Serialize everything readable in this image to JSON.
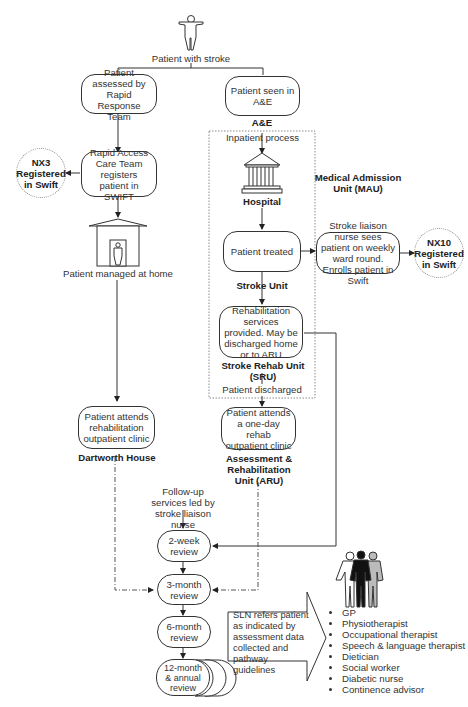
{
  "diagram": {
    "start": {
      "icon": "person-icon",
      "label": "Patient with stroke"
    },
    "left_branch": {
      "rrt_box": "Patient assessed by Rapid Response Team",
      "rapid_access_box": "Rapid Access Care Team registers patient in SWIFT",
      "nx3_badge": "NX3 Registered in Swift",
      "home_icon": "house-icon",
      "home_label": "Patient managed at home",
      "clinic_box": "Patient attends rehabilitation outpatient clinic",
      "clinic_location": "Dartworth House"
    },
    "right_branch": {
      "ae_box": "Patient seen in A&E",
      "ae_label": "A&E",
      "inpatient_label": "Inpatient process",
      "hospital_icon": "hospital-icon",
      "hospital_label": "Hospital",
      "mau_label": "Medical Admission Unit (MAU)",
      "treated_box": "Patient treated",
      "stroke_unit_label": "Stroke Unit",
      "liaison_box": "Stroke liaison nurse sees patient on weekly ward round. Enrolls patient in Swift",
      "nx10_badge": "NX10 Registered in Swift",
      "rehab_box": "Rehabilitation services provided. May be discharged home or to ARU",
      "sru_label": "Stroke Rehab Unit (SRU)",
      "discharged_label": "Patient discharged",
      "aru_box": "Patient attends a one-day rehab outpatient clinic",
      "aru_label": "Assessment & Rehabilitation Unit (ARU)"
    },
    "follow_up": {
      "label": "Follow-up services led by stroke liaison nurse",
      "reviews": [
        "2-week review",
        "3-month review",
        "6-month review",
        "12-month & annual review"
      ],
      "referral_arrow": "SLN refers patient as indicated by assessment data collected and pathway guidelines",
      "team_icon": "team-icon",
      "roles": [
        "GP",
        "Physiotherapist",
        "Occupational therapist",
        "Speech & language therapist",
        "Dietician",
        "Social worker",
        "Diabetic nurse",
        "Continence advisor"
      ]
    }
  }
}
